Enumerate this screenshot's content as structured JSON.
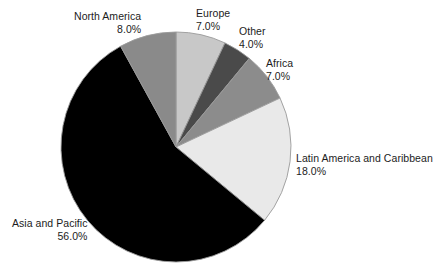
{
  "chart_data": {
    "type": "pie",
    "title": "",
    "subtitle": "",
    "xlabel": "",
    "ylabel": "",
    "legend_position": "none",
    "grid": false,
    "start_angle_deg": 0,
    "direction": "clockwise",
    "center": {
      "x": 176,
      "y": 147
    },
    "radius": 115,
    "value_unit": "%",
    "categories": [
      "Europe",
      "Other",
      "Africa",
      "Latin America and Caribbean",
      "Asia and Pacific",
      "North America"
    ],
    "values": [
      7.0,
      4.0,
      7.0,
      18.0,
      56.0,
      8.0
    ],
    "slices": [
      {
        "label": "Europe",
        "value": 7.0,
        "value_text": "7.0%",
        "color": "#c8c8c8",
        "start_deg": 0.0,
        "end_deg": 25.2
      },
      {
        "label": "Other",
        "value": 4.0,
        "value_text": "4.0%",
        "color": "#4a4a4a",
        "start_deg": 25.2,
        "end_deg": 39.6
      },
      {
        "label": "Africa",
        "value": 7.0,
        "value_text": "7.0%",
        "color": "#8c8c8c",
        "start_deg": 39.6,
        "end_deg": 64.8
      },
      {
        "label": "Latin America and Caribbean",
        "value": 18.0,
        "value_text": "18.0%",
        "color": "#e9e9e9",
        "start_deg": 64.8,
        "end_deg": 129.6
      },
      {
        "label": "Asia and Pacific",
        "value": 56.0,
        "value_text": "56.0%",
        "color": "#000000",
        "start_deg": 129.6,
        "end_deg": 331.2
      },
      {
        "label": "North America",
        "value": 8.0,
        "value_text": "8.0%",
        "color": "#8a8a8a",
        "start_deg": 331.2,
        "end_deg": 360.0
      }
    ],
    "outline_color": "#9a9a9a",
    "background": "#ffffff"
  },
  "labels": {
    "north_america": {
      "name": "North America",
      "pct": "8.0%"
    },
    "europe": {
      "name": "Europe",
      "pct": "7.0%"
    },
    "other": {
      "name": "Other",
      "pct": "4.0%"
    },
    "africa": {
      "name": "Africa",
      "pct": "7.0%"
    },
    "latin_america": {
      "name": "Latin America and Caribbean",
      "pct": "18.0%"
    },
    "asia_pacific": {
      "name": "Asia and Pacific",
      "pct": "56.0%"
    }
  }
}
